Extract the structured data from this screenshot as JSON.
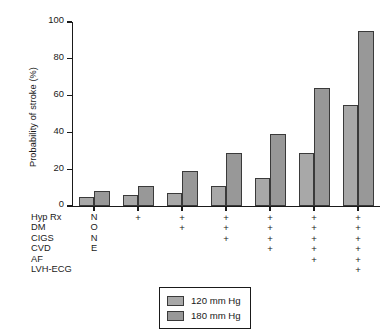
{
  "chart_data": {
    "type": "bar",
    "title": "",
    "xlabel": "",
    "ylabel": "Probability of stroke (%)",
    "ylim": [
      0,
      100
    ],
    "yticks": [
      0,
      20,
      40,
      60,
      80,
      100
    ],
    "grid": false,
    "legend_position": "below-axes-center",
    "categories": [
      "NONE",
      "Hyp Rx",
      "Hyp Rx + DM",
      "Hyp Rx + DM + CIGS",
      "Hyp Rx + DM + CIGS + CVD",
      "Hyp Rx + DM + CIGS + CVD + AF",
      "Hyp Rx + DM + CIGS + CVD + AF + LVH-ECG"
    ],
    "series": [
      {
        "name": "120 mm Hg",
        "color": "#a8a8a8",
        "values": [
          5,
          6,
          7,
          11,
          15,
          29,
          55
        ]
      },
      {
        "name": "180 mm Hg",
        "color": "#989898",
        "values": [
          8,
          11,
          19,
          29,
          39,
          64,
          95
        ]
      }
    ],
    "factor_matrix": {
      "row_labels": [
        "Hyp Rx",
        "DM",
        "CIGS",
        "CVD",
        "AF",
        "LVH-ECG"
      ],
      "first_column_text": [
        "N",
        "O",
        "N",
        "E"
      ],
      "marks": [
        [
          "N",
          "+",
          "+",
          "+",
          "+",
          "+",
          "+"
        ],
        [
          "O",
          "",
          "+",
          "+",
          "+",
          "+",
          "+"
        ],
        [
          "N",
          "",
          "",
          "+",
          "+",
          "+",
          "+"
        ],
        [
          "E",
          "",
          "",
          "",
          "+",
          "+",
          "+"
        ],
        [
          "",
          "",
          "",
          "",
          "",
          "+",
          "+"
        ],
        [
          "",
          "",
          "",
          "",
          "",
          "",
          "+"
        ]
      ]
    }
  },
  "legend": {
    "items": [
      {
        "label": "120 mm Hg"
      },
      {
        "label": "180 mm Hg"
      }
    ]
  }
}
